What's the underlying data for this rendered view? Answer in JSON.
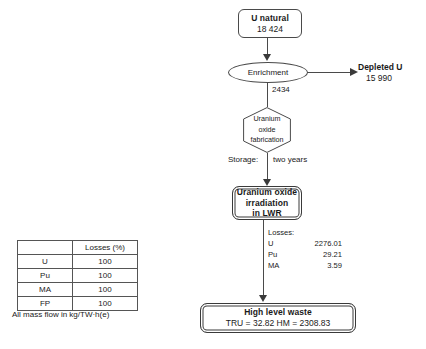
{
  "diagram": {
    "nodes": {
      "u_natural": {
        "title": "U natural",
        "value": "18 424"
      },
      "enrichment": {
        "label": "Enrichment"
      },
      "depleted": {
        "title": "Depleted U",
        "value": "15 990"
      },
      "fabrication": {
        "line1": "Uranium",
        "line2": "oxide",
        "line3": "fabrication"
      },
      "irradiation": {
        "line1": "Uranium oxide",
        "line2": "irradiation",
        "line3": "in LWR"
      },
      "hlw": {
        "title": "High level waste",
        "value": "TRU = 32.82  HM = 2308.83"
      }
    },
    "flow_labels": {
      "enriched_stream": "2434",
      "storage_key": "Storage:",
      "storage_value": "two years"
    },
    "losses_block": {
      "heading": "Losses:",
      "rows": [
        {
          "name": "U",
          "value": "2276.01"
        },
        {
          "name": "Pu",
          "value": "29.21"
        },
        {
          "name": "MA",
          "value": "3.59"
        }
      ]
    }
  },
  "loss_table": {
    "corner": "",
    "header": "Losses (%)",
    "rows": [
      {
        "label": "U",
        "value": "100"
      },
      {
        "label": "Pu",
        "value": "100"
      },
      {
        "label": "MA",
        "value": "100"
      },
      {
        "label": "FP",
        "value": "100"
      }
    ]
  },
  "footnote": "All mass flow in kg/TW·h(e)"
}
